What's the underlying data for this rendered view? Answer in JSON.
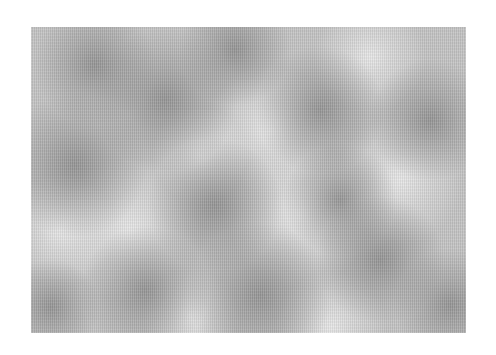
{
  "image": {
    "description": "Grayscale cloud / Perlin noise texture on white background",
    "canvas": {
      "width": 496,
      "height": 355,
      "background": "#ffffff"
    },
    "texture_bounds": {
      "left": 31,
      "top": 27,
      "width": 435,
      "height": 306
    },
    "base_color": "#c4c4c4",
    "dark_color": "#8e8e8e",
    "light_color": "#ececec",
    "dark_blobs": [
      {
        "x": 44,
        "y": 138,
        "r": 45
      },
      {
        "x": 134,
        "y": 73,
        "r": 45
      },
      {
        "x": 184,
        "y": 178,
        "r": 42
      },
      {
        "x": 289,
        "y": 83,
        "r": 40
      },
      {
        "x": 399,
        "y": 93,
        "r": 38
      },
      {
        "x": 229,
        "y": 268,
        "r": 45
      },
      {
        "x": 114,
        "y": 263,
        "r": 40
      },
      {
        "x": 349,
        "y": 233,
        "r": 40
      },
      {
        "x": 64,
        "y": 38,
        "r": 38
      },
      {
        "x": 309,
        "y": 173,
        "r": 35
      },
      {
        "x": 204,
        "y": 23,
        "r": 35
      },
      {
        "x": 419,
        "y": 278,
        "r": 35
      },
      {
        "x": 20,
        "y": 280,
        "r": 30
      }
    ],
    "light_blobs": [
      {
        "x": 239,
        "y": 103,
        "r": 40
      },
      {
        "x": 269,
        "y": 188,
        "r": 45
      },
      {
        "x": 99,
        "y": 203,
        "r": 45
      },
      {
        "x": 29,
        "y": 203,
        "r": 35
      },
      {
        "x": 369,
        "y": 153,
        "r": 40
      },
      {
        "x": 169,
        "y": 128,
        "r": 30
      },
      {
        "x": 339,
        "y": 30,
        "r": 35
      },
      {
        "x": 160,
        "y": 290,
        "r": 30
      },
      {
        "x": 300,
        "y": 300,
        "r": 35
      }
    ]
  }
}
